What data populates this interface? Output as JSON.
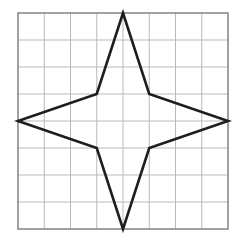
{
  "figure": {
    "grid": {
      "columns": 8,
      "rows": 8,
      "origin_px": [
        18,
        13
      ],
      "cell_width_px": 26.25,
      "cell_height_px": 27,
      "line_color": "#b9b9b9",
      "border_color": "#8a8a8a"
    },
    "star": {
      "stroke_color": "#1e1e1e",
      "stroke_width": 2.6,
      "fill": "none",
      "vertices_grid": [
        [
          4,
          0
        ],
        [
          5,
          3
        ],
        [
          8,
          4
        ],
        [
          5,
          5
        ],
        [
          4,
          8
        ],
        [
          3,
          5
        ],
        [
          0,
          4
        ],
        [
          3,
          3
        ]
      ]
    }
  }
}
